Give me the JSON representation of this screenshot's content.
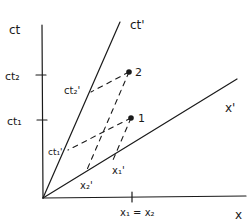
{
  "diagram": {
    "type": "spacetime-minkowski",
    "axes": {
      "ct": "ct",
      "x": "x",
      "ct_prime": "ct'",
      "x_prime": "x'"
    },
    "ticks": {
      "ct2": "ct₂",
      "ct1": "ct₁",
      "ct2_prime": "ct₂'",
      "ct1_prime": "ct₁'",
      "x1_prime": "x₁'",
      "x2_prime": "x₂'",
      "x1_eq_x2": "x₁ = x₂"
    },
    "events": [
      {
        "label": "1"
      },
      {
        "label": "2"
      }
    ],
    "colors": {
      "ink": "#1a1a1a",
      "background": "#ffffff"
    }
  }
}
